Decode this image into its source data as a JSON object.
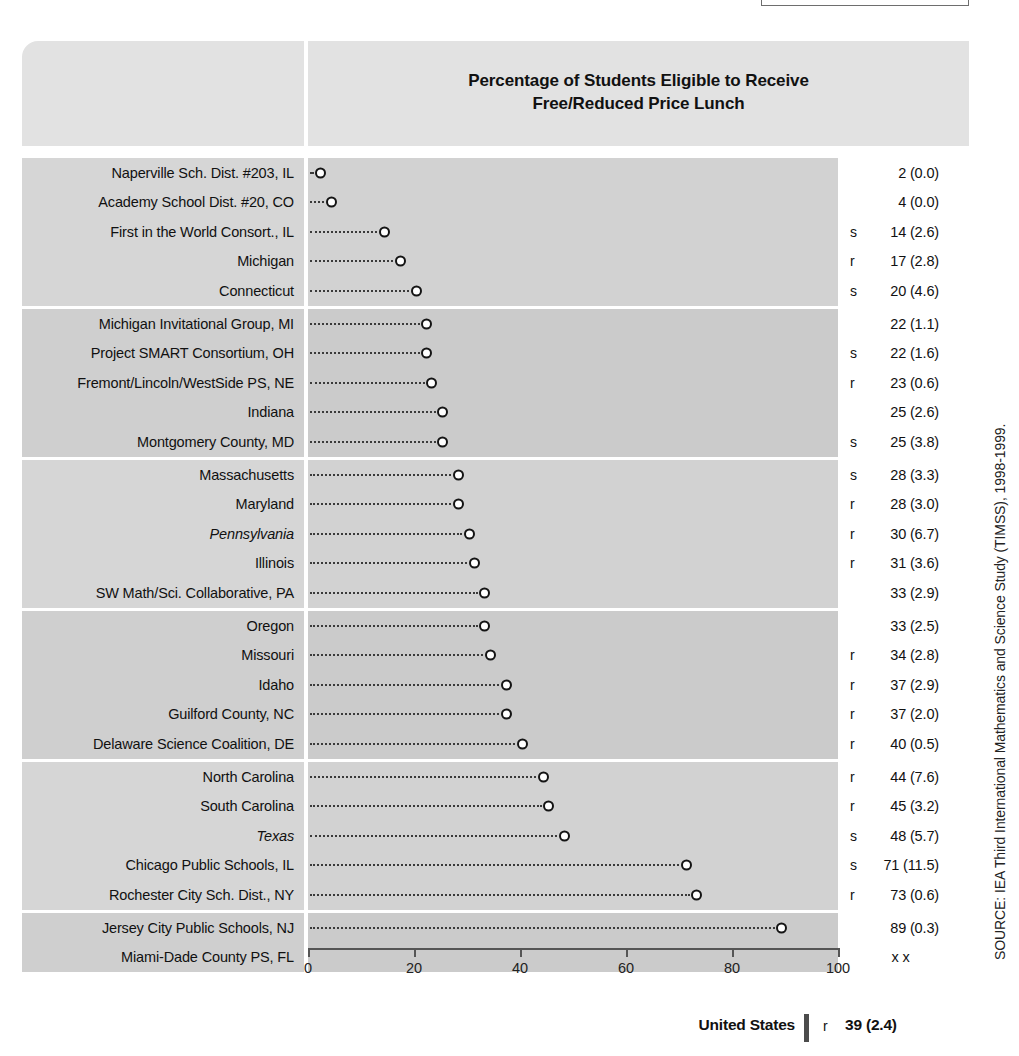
{
  "top_stub": {
    "name": "partial-table-box"
  },
  "header": {
    "title_line1": "Percentage of Students Eligible to Receive",
    "title_line2": "Free/Reduced Price Lunch"
  },
  "axis": {
    "min": 0,
    "max": 100,
    "ticks": [
      0,
      20,
      40,
      60,
      80,
      100
    ],
    "tick_labels": [
      "0",
      "20",
      "40",
      "60",
      "80",
      "100"
    ]
  },
  "source": "SOURCE: IEA Third International Mathematics and Science Study (TIMSS), 1998-1999.",
  "footer": {
    "label": "United States",
    "flag": "r",
    "value": "39 (2.4)"
  },
  "chart_data": {
    "type": "bar",
    "title": "Percentage of Students Eligible to Receive Free/Reduced Price Lunch",
    "xlabel": "",
    "ylabel": "",
    "xlim": [
      0,
      100
    ],
    "grid": false,
    "legend": "none",
    "categories": [
      "Naperville Sch. Dist. #203, IL",
      "Academy School Dist. #20, CO",
      "First in the World Consort., IL",
      "Michigan",
      "Connecticut",
      "Michigan Invitational Group, MI",
      "Project SMART Consortium, OH",
      "Fremont/Lincoln/WestSide PS, NE",
      "Indiana",
      "Montgomery County, MD",
      "Massachusetts",
      "Maryland",
      "Pennsylvania",
      "Illinois",
      "SW Math/Sci. Collaborative, PA",
      "Oregon",
      "Missouri",
      "Idaho",
      "Guilford County, NC",
      "Delaware Science Coalition, DE",
      "North Carolina",
      "South Carolina",
      "Texas",
      "Chicago Public Schools, IL",
      "Rochester City Sch. Dist., NY",
      "Jersey City Public Schools, NJ",
      "Miami-Dade County PS, FL"
    ],
    "values": [
      2,
      4,
      14,
      17,
      20,
      22,
      22,
      23,
      25,
      25,
      28,
      28,
      30,
      31,
      33,
      33,
      34,
      37,
      37,
      40,
      44,
      45,
      48,
      71,
      73,
      89,
      null
    ],
    "standard_errors": [
      0.0,
      0.0,
      2.6,
      2.8,
      4.6,
      1.1,
      1.6,
      0.6,
      2.6,
      3.8,
      3.3,
      3.0,
      6.7,
      3.6,
      2.9,
      2.5,
      2.8,
      2.9,
      2.0,
      0.5,
      7.6,
      3.2,
      5.7,
      11.5,
      0.6,
      0.3,
      null
    ],
    "united_states": {
      "value": 39,
      "standard_error": 2.4,
      "flag": "r"
    }
  },
  "rows": [
    {
      "label": "Naperville Sch. Dist. #203, IL",
      "italic": false,
      "flag": "",
      "value": 2,
      "display": "2 (0.0)",
      "group": 0
    },
    {
      "label": "Academy School Dist. #20, CO",
      "italic": false,
      "flag": "",
      "value": 4,
      "display": "4 (0.0)",
      "group": 0
    },
    {
      "label": "First in the World Consort., IL",
      "italic": false,
      "flag": "s",
      "value": 14,
      "display": "14 (2.6)",
      "group": 0
    },
    {
      "label": "Michigan",
      "italic": false,
      "flag": "r",
      "value": 17,
      "display": "17 (2.8)",
      "group": 0
    },
    {
      "label": "Connecticut",
      "italic": false,
      "flag": "s",
      "value": 20,
      "display": "20 (4.6)",
      "group": 0
    },
    {
      "label": "Michigan Invitational Group, MI",
      "italic": false,
      "flag": "",
      "value": 22,
      "display": "22 (1.1)",
      "group": 1
    },
    {
      "label": "Project SMART Consortium, OH",
      "italic": false,
      "flag": "s",
      "value": 22,
      "display": "22 (1.6)",
      "group": 1
    },
    {
      "label": "Fremont/Lincoln/WestSide PS, NE",
      "italic": false,
      "flag": "r",
      "value": 23,
      "display": "23 (0.6)",
      "group": 1
    },
    {
      "label": "Indiana",
      "italic": false,
      "flag": "",
      "value": 25,
      "display": "25 (2.6)",
      "group": 1
    },
    {
      "label": "Montgomery County, MD",
      "italic": false,
      "flag": "s",
      "value": 25,
      "display": "25 (3.8)",
      "group": 1
    },
    {
      "label": "Massachusetts",
      "italic": false,
      "flag": "s",
      "value": 28,
      "display": "28 (3.3)",
      "group": 2
    },
    {
      "label": "Maryland",
      "italic": false,
      "flag": "r",
      "value": 28,
      "display": "28 (3.0)",
      "group": 2
    },
    {
      "label": "Pennsylvania",
      "italic": true,
      "flag": "r",
      "value": 30,
      "display": "30 (6.7)",
      "group": 2
    },
    {
      "label": "Illinois",
      "italic": false,
      "flag": "r",
      "value": 31,
      "display": "31 (3.6)",
      "group": 2
    },
    {
      "label": "SW Math/Sci. Collaborative, PA",
      "italic": false,
      "flag": "",
      "value": 33,
      "display": "33 (2.9)",
      "group": 2
    },
    {
      "label": "Oregon",
      "italic": false,
      "flag": "",
      "value": 33,
      "display": "33 (2.5)",
      "group": 3
    },
    {
      "label": "Missouri",
      "italic": false,
      "flag": "r",
      "value": 34,
      "display": "34 (2.8)",
      "group": 3
    },
    {
      "label": "Idaho",
      "italic": false,
      "flag": "r",
      "value": 37,
      "display": "37 (2.9)",
      "group": 3
    },
    {
      "label": "Guilford County, NC",
      "italic": false,
      "flag": "r",
      "value": 37,
      "display": "37 (2.0)",
      "group": 3
    },
    {
      "label": "Delaware Science Coalition, DE",
      "italic": false,
      "flag": "r",
      "value": 40,
      "display": "40 (0.5)",
      "group": 3
    },
    {
      "label": "North Carolina",
      "italic": false,
      "flag": "r",
      "value": 44,
      "display": "44 (7.6)",
      "group": 4
    },
    {
      "label": "South Carolina",
      "italic": false,
      "flag": "r",
      "value": 45,
      "display": "45 (3.2)",
      "group": 4
    },
    {
      "label": "Texas",
      "italic": true,
      "flag": "s",
      "value": 48,
      "display": "48 (5.7)",
      "group": 4
    },
    {
      "label": "Chicago Public Schools, IL",
      "italic": false,
      "flag": "s",
      "value": 71,
      "display": "71 (11.5)",
      "group": 4
    },
    {
      "label": "Rochester City Sch. Dist., NY",
      "italic": false,
      "flag": "r",
      "value": 73,
      "display": "73 (0.6)",
      "group": 4
    },
    {
      "label": "Jersey City Public Schools, NJ",
      "italic": false,
      "flag": "",
      "value": 89,
      "display": "89 (0.3)",
      "group": 5
    },
    {
      "label": "Miami-Dade County PS, FL",
      "italic": false,
      "flag": "",
      "value": null,
      "display": "x x",
      "group": 5
    }
  ]
}
